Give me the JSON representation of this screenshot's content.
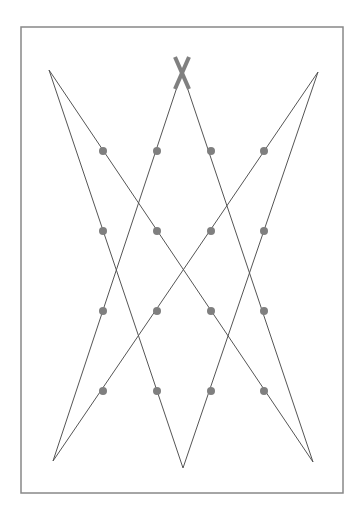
{
  "canvas": {
    "width": 364,
    "height": 516,
    "background": "#ffffff"
  },
  "frame": {
    "x": 21,
    "y": 27,
    "width": 322,
    "height": 466,
    "stroke": "#888888"
  },
  "vertices": {
    "top_left": [
      49,
      70
    ],
    "top_center": [
      182,
      72
    ],
    "top_right": [
      318,
      72
    ],
    "bottom_left": [
      53,
      461
    ],
    "bottom_center": [
      183,
      468
    ],
    "bottom_right": [
      313,
      462
    ]
  },
  "lines": [
    {
      "from": "top_left",
      "to": "bottom_center"
    },
    {
      "from": "top_left",
      "to": "bottom_right"
    },
    {
      "from": "top_center",
      "to": "bottom_left"
    },
    {
      "from": "top_center",
      "to": "bottom_right"
    },
    {
      "from": "top_right",
      "to": "bottom_left"
    },
    {
      "from": "top_right",
      "to": "bottom_center"
    }
  ],
  "line_color": "#555555",
  "marker": {
    "type": "x",
    "center": [
      182,
      73
    ],
    "half_w": 7,
    "half_h": 16,
    "color": "#808080",
    "stroke_width": 4
  },
  "dots": {
    "color": "#7f7f7f",
    "radius": 4,
    "columns": [
      103,
      157,
      211,
      264
    ],
    "rows": [
      151,
      231,
      311,
      391
    ]
  }
}
